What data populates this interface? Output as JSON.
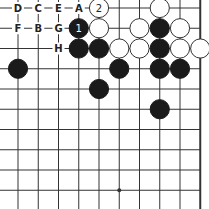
{
  "diagram": {
    "board": {
      "visible_columns": 10,
      "visible_rows": 10,
      "right_edge": true,
      "top_edge": false,
      "star_points": [
        [
          5,
          9
        ]
      ]
    },
    "stones": [
      {
        "color": "white",
        "col": 4,
        "row": 0,
        "label": "2"
      },
      {
        "color": "white",
        "col": 7,
        "row": 0,
        "label": ""
      },
      {
        "color": "black",
        "col": 3,
        "row": 1,
        "label": "1"
      },
      {
        "color": "white",
        "col": 4,
        "row": 1,
        "label": ""
      },
      {
        "color": "white",
        "col": 6,
        "row": 1,
        "label": ""
      },
      {
        "color": "black",
        "col": 7,
        "row": 1,
        "label": ""
      },
      {
        "color": "white",
        "col": 8,
        "row": 1,
        "label": ""
      },
      {
        "color": "black",
        "col": 3,
        "row": 2,
        "label": ""
      },
      {
        "color": "black",
        "col": 4,
        "row": 2,
        "label": ""
      },
      {
        "color": "white",
        "col": 5,
        "row": 2,
        "label": ""
      },
      {
        "color": "white",
        "col": 6,
        "row": 2,
        "label": ""
      },
      {
        "color": "black",
        "col": 7,
        "row": 2,
        "label": ""
      },
      {
        "color": "white",
        "col": 8,
        "row": 2,
        "label": ""
      },
      {
        "color": "white",
        "col": 9,
        "row": 2,
        "label": ""
      },
      {
        "color": "black",
        "col": 0,
        "row": 3,
        "label": ""
      },
      {
        "color": "black",
        "col": 5,
        "row": 3,
        "label": ""
      },
      {
        "color": "black",
        "col": 7,
        "row": 3,
        "label": ""
      },
      {
        "color": "black",
        "col": 8,
        "row": 3,
        "label": ""
      },
      {
        "color": "black",
        "col": 4,
        "row": 4,
        "label": ""
      },
      {
        "color": "black",
        "col": 7,
        "row": 5,
        "label": ""
      }
    ],
    "point_labels": [
      {
        "text": "D",
        "col": 0,
        "row": 0
      },
      {
        "text": "C",
        "col": 1,
        "row": 0
      },
      {
        "text": "E",
        "col": 2,
        "row": 0
      },
      {
        "text": "A",
        "col": 3,
        "row": 0
      },
      {
        "text": "F",
        "col": 0,
        "row": 1
      },
      {
        "text": "B",
        "col": 1,
        "row": 1
      },
      {
        "text": "G",
        "col": 2,
        "row": 1
      },
      {
        "text": "H",
        "col": 2,
        "row": 2
      }
    ],
    "colors": {
      "black_stone": "#1a1a1a",
      "white_stone": "#ffffff",
      "line": "#333333",
      "background": "#ffffff"
    }
  }
}
